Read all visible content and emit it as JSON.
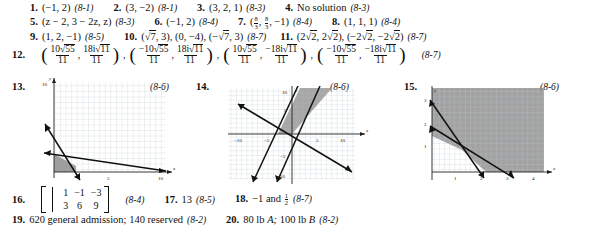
{
  "page": {
    "type": "answer-key",
    "background": "#ffffff",
    "text_color": "#111111"
  },
  "answers": [
    {
      "n": "1.",
      "text": "(−1, 2)",
      "ref": "(8-1)"
    },
    {
      "n": "2.",
      "text": "(3, −2)",
      "ref": "(8-1)"
    },
    {
      "n": "3.",
      "text": "(3, 2, 1)",
      "ref": "(8-3)"
    },
    {
      "n": "4.",
      "text": "No solution",
      "ref": "(8-3)"
    },
    {
      "n": "5.",
      "text": "(z − 2, 3 − 2z, z)",
      "ref": "(8-3)"
    },
    {
      "n": "6.",
      "text": "(−1, 2)",
      "ref": "(8-4)"
    },
    {
      "n": "7.",
      "text": "(8/3, 8/3, −1)",
      "ref": "(8-4)"
    },
    {
      "n": "8.",
      "text": "(1, 1, 1)",
      "ref": "(8-4)"
    },
    {
      "n": "9.",
      "text": "(1, 2, −1)",
      "ref": "(8-5)"
    },
    {
      "n": "10.",
      "text": "(√7, 3), (0, −4), (−√7, 3)",
      "ref": "(8-7)"
    },
    {
      "n": "11.",
      "text": "(2√2, 2√2), (−2√2, −2√2)",
      "ref": "(8-7)"
    },
    {
      "n": "12.",
      "text": "(10√55/11, 18i√11/11), (−10√55/11, 18i√11/11), (10√55/11, −18i√11/11), (−10√55/11, −18i√11/11)",
      "ref": "(8-7)"
    },
    {
      "n": "13.",
      "text": "graph",
      "ref": "(8-6)"
    },
    {
      "n": "14.",
      "text": "graph",
      "ref": "(8-6)"
    },
    {
      "n": "15.",
      "text": "graph",
      "ref": "(8-6)"
    },
    {
      "n": "16.",
      "text": "matrix [1 -1 | -3 ; 3 6 | 9]",
      "ref": "(8-4)"
    },
    {
      "n": "17.",
      "text": "13",
      "ref": "(8-5)"
    },
    {
      "n": "18.",
      "text": "−1 and 1/2",
      "ref": "(8-7)"
    },
    {
      "n": "19.",
      "text": "620 general admission; 140 reserved",
      "ref": "(8-2)"
    },
    {
      "n": "20.",
      "text": "80 lb A; 100 lb B",
      "ref": "(8-2)"
    }
  ],
  "item1": {
    "num": "1.",
    "open": "(",
    "x": "−1,",
    "y": "2",
    "close": ")",
    "ref": "(8-1)"
  },
  "item2": {
    "num": "2.",
    "open": "(",
    "x": "3,",
    "y": "−2",
    "close": ")",
    "ref": "(8-1)"
  },
  "item3": {
    "num": "3.",
    "open": "(",
    "body": "3, 2, 1",
    "close": ")",
    "ref": "(8-3)"
  },
  "item4": {
    "num": "4.",
    "body": "No solution",
    "ref": "(8-3)"
  },
  "item5": {
    "num": "5.",
    "open": "(",
    "body": "z − 2, 3 − 2z, z",
    "close": ")",
    "ref": "(8-3)"
  },
  "item6": {
    "num": "6.",
    "open": "(",
    "body": "−1, 2",
    "close": ")",
    "ref": "(8-4)"
  },
  "item7": {
    "num": "7.",
    "open": "(",
    "f1n": "8",
    "f1d": "3",
    "comma1": ",",
    "f2n": "8",
    "f2d": "3",
    "comma2": ",",
    "tail": "−1",
    "close": ")",
    "ref": "(8-4)"
  },
  "item8": {
    "num": "8.",
    "open": "(",
    "body": "1, 1, 1",
    "close": ")",
    "ref": "(8-4)"
  },
  "item9": {
    "num": "9.",
    "open": "(",
    "body": "1, 2, −1",
    "close": ")",
    "ref": "(8-5)"
  },
  "item10": {
    "num": "10.",
    "p1open": "(",
    "p1rad": "7",
    "p1tail": ", 3",
    "p1close": "),",
    "p2": "(0, −4),",
    "p3open": "(−",
    "p3rad": "7",
    "p3tail": ", 3",
    "p3close": ")",
    "ref": "(8-7)"
  },
  "item11": {
    "num": "11.",
    "p1open": "(2",
    "p1rad": "2",
    "p1mid": ", 2",
    "p1rad2": "2",
    "p1close": "),",
    "p2open": "(−2",
    "p2rad": "2",
    "p2mid": ", −2",
    "p2rad2": "2",
    "p2close": ")",
    "ref": "(8-7)"
  },
  "item12": {
    "num": "12.",
    "ref": "(8-7)",
    "groups": [
      {
        "n1pre": "10",
        "n1rad": "55",
        "d1": "11",
        "n2pre": "18i",
        "n2rad": "11",
        "d2": "11",
        "after": ","
      },
      {
        "n1pre": "−10",
        "n1rad": "55",
        "d1": "11",
        "n2pre": "18i",
        "n2rad": "11",
        "d2": "11",
        "after": ","
      },
      {
        "n1pre": "10",
        "n1rad": "55",
        "d1": "11",
        "n2pre": "−18i",
        "n2rad": "11",
        "d2": "11",
        "after": ","
      },
      {
        "n1pre": "−10",
        "n1rad": "55",
        "d1": "11",
        "n2pre": "−18i",
        "n2rad": "11",
        "d2": "11",
        "after": ""
      }
    ]
  },
  "item13": {
    "num": "13.",
    "ref": "(8-6)",
    "axis_x_label": "x",
    "axis_y_label": "y",
    "y_top_tick": "10",
    "y_mid_tick": "5",
    "x_tick_5": "5",
    "x_tick_10": "10"
  },
  "item14": {
    "num": "14.",
    "ref": "(8-6)",
    "axis_x_label": "x",
    "axis_y_label": "y",
    "ticks_x": [
      "−10",
      "−5",
      "5",
      "10"
    ],
    "ticks_y": [
      "10",
      "5",
      "−5",
      "−10"
    ]
  },
  "item15": {
    "num": "15.",
    "ref": "(8-6)",
    "axis_x_label": "x",
    "axis_y_label": "y",
    "ticks_x": [
      "1",
      "2",
      "3",
      "4"
    ],
    "ticks_y": [
      "1",
      "2",
      "3"
    ]
  },
  "item16": {
    "num": "16.",
    "ref": "(8-4)",
    "rows": [
      [
        "1",
        "−1",
        "−3"
      ],
      [
        "3",
        "6",
        "9"
      ]
    ]
  },
  "item17": {
    "num": "17.",
    "body": "13",
    "ref": "(8-5)"
  },
  "item18": {
    "num": "18.",
    "pre": "−1 and",
    "fn": "1",
    "fd": "2",
    "ref": "(8-7)"
  },
  "item19": {
    "num": "19.",
    "body": "620 general admission; 140 reserved",
    "ref": "(8-2)"
  },
  "item20": {
    "num": "20.",
    "pre": "80 lb",
    "var1": "A;",
    "mid": "100 lb",
    "var2": "B",
    "ref": "(8-2)"
  },
  "colors": {
    "grid": "#b9c6cf",
    "shade": "#9a9a9a",
    "line": "#1a1a1a",
    "axis": "#333333"
  }
}
